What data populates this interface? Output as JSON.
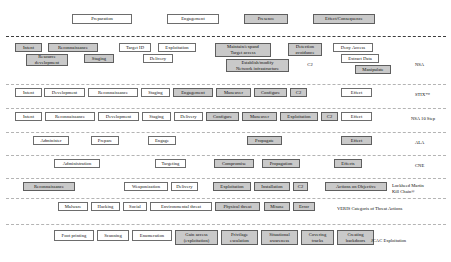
{
  "diagram": {
    "phase_header": {
      "label": "attack-phase-header",
      "items": [
        {
          "text": "Preparation",
          "shaded": false,
          "x": 72,
          "y": 14,
          "w": 60,
          "h": 10
        },
        {
          "text": "Engagement",
          "shaded": false,
          "x": 167,
          "y": 14,
          "w": 52,
          "h": 10
        },
        {
          "text": "Presence",
          "shaded": true,
          "x": 244,
          "y": 14,
          "w": 44,
          "h": 10
        },
        {
          "text": "Effect/Consequence",
          "shaded": true,
          "x": 313,
          "y": 14,
          "w": 62,
          "h": 10
        }
      ]
    },
    "rows": [
      {
        "label": "NSA",
        "label_x": 415,
        "label_y": 62,
        "boxes": [
          {
            "text": "Intent",
            "shaded": true,
            "x": 15,
            "y": 43,
            "w": 27,
            "h": 9
          },
          {
            "text": "Reconnaissance",
            "shaded": true,
            "x": 48,
            "y": 43,
            "w": 50,
            "h": 9
          },
          {
            "text": "Resource\ndevelopment",
            "shaded": true,
            "x": 26,
            "y": 54,
            "w": 42,
            "h": 12
          },
          {
            "text": "Staging",
            "shaded": true,
            "x": 84,
            "y": 54,
            "w": 30,
            "h": 9
          },
          {
            "text": "Target ID",
            "shaded": false,
            "x": 119,
            "y": 43,
            "w": 32,
            "h": 9
          },
          {
            "text": "Exploitation",
            "shaded": false,
            "x": 158,
            "y": 43,
            "w": 38,
            "h": 9
          },
          {
            "text": "Delivery",
            "shaded": false,
            "x": 143,
            "y": 54,
            "w": 30,
            "h": 9
          },
          {
            "text": "Maintain/expand\nTarget access",
            "shaded": true,
            "x": 215,
            "y": 43,
            "w": 56,
            "h": 14
          },
          {
            "text": "Establish/modify\nNetwork infrastructure",
            "shaded": true,
            "x": 226,
            "y": 59,
            "w": 63,
            "h": 13
          },
          {
            "text": "Detection\navoidance",
            "shaded": true,
            "x": 288,
            "y": 43,
            "w": 34,
            "h": 13
          },
          {
            "text": "C2",
            "shaded": false,
            "x": 304,
            "y": 61,
            "w": 12,
            "h": 8,
            "plain": true
          },
          {
            "text": "Deny Access",
            "shaded": false,
            "x": 333,
            "y": 43,
            "w": 40,
            "h": 9
          },
          {
            "text": "Extract Data",
            "shaded": false,
            "x": 341,
            "y": 54,
            "w": 38,
            "h": 9
          },
          {
            "text": "Manipulate",
            "shaded": true,
            "x": 355,
            "y": 65,
            "w": 36,
            "h": 9
          }
        ]
      },
      {
        "label": "STIX™",
        "label_x": 415,
        "label_y": 92,
        "boxes": [
          {
            "text": "Intent",
            "shaded": false,
            "x": 15,
            "y": 88,
            "w": 27,
            "h": 9
          },
          {
            "text": "Development",
            "shaded": false,
            "x": 44,
            "y": 88,
            "w": 41,
            "h": 9
          },
          {
            "text": "Reconnaissance",
            "shaded": false,
            "x": 88,
            "y": 88,
            "w": 50,
            "h": 9
          },
          {
            "text": "Staging",
            "shaded": false,
            "x": 141,
            "y": 88,
            "w": 29,
            "h": 9
          },
          {
            "text": "Engagement",
            "shaded": true,
            "x": 173,
            "y": 88,
            "w": 40,
            "h": 9
          },
          {
            "text": "Maneuver",
            "shaded": true,
            "x": 216,
            "y": 88,
            "w": 35,
            "h": 9
          },
          {
            "text": "Configure",
            "shaded": true,
            "x": 254,
            "y": 88,
            "w": 33,
            "h": 9
          },
          {
            "text": "C2",
            "shaded": true,
            "x": 290,
            "y": 88,
            "w": 17,
            "h": 9
          },
          {
            "text": "Effect",
            "shaded": false,
            "x": 341,
            "y": 88,
            "w": 31,
            "h": 9
          }
        ]
      },
      {
        "label": "NSA 10 Step",
        "label_x": 411,
        "label_y": 116,
        "boxes": [
          {
            "text": "Intent",
            "shaded": false,
            "x": 15,
            "y": 112,
            "w": 27,
            "h": 9
          },
          {
            "text": "Reconnaissance",
            "shaded": false,
            "x": 45,
            "y": 112,
            "w": 50,
            "h": 9
          },
          {
            "text": "Development",
            "shaded": false,
            "x": 98,
            "y": 112,
            "w": 41,
            "h": 9
          },
          {
            "text": "Staging",
            "shaded": false,
            "x": 142,
            "y": 112,
            "w": 29,
            "h": 9
          },
          {
            "text": "Delivery",
            "shaded": false,
            "x": 174,
            "y": 112,
            "w": 29,
            "h": 9
          },
          {
            "text": "Configure",
            "shaded": true,
            "x": 206,
            "y": 112,
            "w": 33,
            "h": 9
          },
          {
            "text": "Maneuver",
            "shaded": true,
            "x": 242,
            "y": 112,
            "w": 35,
            "h": 9
          },
          {
            "text": "Exploitation",
            "shaded": true,
            "x": 280,
            "y": 112,
            "w": 38,
            "h": 9
          },
          {
            "text": "C2",
            "shaded": true,
            "x": 321,
            "y": 112,
            "w": 17,
            "h": 9
          },
          {
            "text": "Effect",
            "shaded": false,
            "x": 341,
            "y": 112,
            "w": 31,
            "h": 9
          }
        ]
      },
      {
        "label": "ALA",
        "label_x": 415,
        "label_y": 140,
        "boxes": [
          {
            "text": "Administer",
            "shaded": false,
            "x": 33,
            "y": 136,
            "w": 36,
            "h": 9
          },
          {
            "text": "Prepare",
            "shaded": false,
            "x": 91,
            "y": 136,
            "w": 28,
            "h": 9
          },
          {
            "text": "Engage",
            "shaded": false,
            "x": 148,
            "y": 136,
            "w": 28,
            "h": 9
          },
          {
            "text": "Propagate",
            "shaded": true,
            "x": 247,
            "y": 136,
            "w": 35,
            "h": 9
          },
          {
            "text": "Effect",
            "shaded": true,
            "x": 341,
            "y": 136,
            "w": 31,
            "h": 9
          }
        ]
      },
      {
        "label": "CNE",
        "label_x": 415,
        "label_y": 163,
        "boxes": [
          {
            "text": "Administration",
            "shaded": false,
            "x": 54,
            "y": 159,
            "w": 46,
            "h": 9
          },
          {
            "text": "Targeting",
            "shaded": false,
            "x": 155,
            "y": 159,
            "w": 31,
            "h": 9
          },
          {
            "text": "Compromise",
            "shaded": true,
            "x": 214,
            "y": 159,
            "w": 40,
            "h": 9
          },
          {
            "text": "Propagation",
            "shaded": true,
            "x": 262,
            "y": 159,
            "w": 38,
            "h": 9
          },
          {
            "text": "Effects",
            "shaded": true,
            "x": 334,
            "y": 159,
            "w": 28,
            "h": 9
          }
        ]
      },
      {
        "label": "Lockheed Martin\nKill Chain®",
        "label_x": 392,
        "label_y": 183,
        "boxes": [
          {
            "text": "Reconnaissance",
            "shaded": true,
            "x": 23,
            "y": 182,
            "w": 52,
            "h": 9
          },
          {
            "text": "Weaponization",
            "shaded": false,
            "x": 124,
            "y": 182,
            "w": 44,
            "h": 9
          },
          {
            "text": "Delivery",
            "shaded": false,
            "x": 171,
            "y": 182,
            "w": 27,
            "h": 9
          },
          {
            "text": "Exploitation",
            "shaded": true,
            "x": 213,
            "y": 182,
            "w": 38,
            "h": 9
          },
          {
            "text": "Installation",
            "shaded": true,
            "x": 254,
            "y": 182,
            "w": 36,
            "h": 9
          },
          {
            "text": "C2",
            "shaded": true,
            "x": 293,
            "y": 182,
            "w": 15,
            "h": 9
          },
          {
            "text": "Actions on Objective",
            "shaded": true,
            "x": 325,
            "y": 182,
            "w": 62,
            "h": 9
          }
        ]
      },
      {
        "label": "VERIS Categoris of Threat Actions",
        "label_x": 337,
        "label_y": 206,
        "boxes": [
          {
            "text": "Malware",
            "shaded": false,
            "x": 58,
            "y": 202,
            "w": 30,
            "h": 9
          },
          {
            "text": "Hacking",
            "shaded": false,
            "x": 91,
            "y": 202,
            "w": 29,
            "h": 9
          },
          {
            "text": "Social",
            "shaded": false,
            "x": 123,
            "y": 202,
            "w": 24,
            "h": 9
          },
          {
            "text": "Environmental threat",
            "shaded": false,
            "x": 150,
            "y": 202,
            "w": 62,
            "h": 9
          },
          {
            "text": "Physical threat",
            "shaded": true,
            "x": 215,
            "y": 202,
            "w": 45,
            "h": 9
          },
          {
            "text": "Misuse",
            "shaded": true,
            "x": 264,
            "y": 202,
            "w": 26,
            "h": 9
          },
          {
            "text": "Error",
            "shaded": true,
            "x": 293,
            "y": 202,
            "w": 22,
            "h": 9
          }
        ]
      },
      {
        "label": "JCAC Exploitation",
        "label_x": 371,
        "label_y": 238,
        "boxes": [
          {
            "text": "Foot printing",
            "shaded": false,
            "x": 54,
            "y": 230,
            "w": 40,
            "h": 11
          },
          {
            "text": "Scanning",
            "shaded": false,
            "x": 97,
            "y": 230,
            "w": 32,
            "h": 11
          },
          {
            "text": "Enumeration",
            "shaded": false,
            "x": 132,
            "y": 230,
            "w": 40,
            "h": 11
          },
          {
            "text": "Gain access\n(exploitation)",
            "shaded": true,
            "x": 175,
            "y": 230,
            "w": 43,
            "h": 15
          },
          {
            "text": "Privilage\nescalation",
            "shaded": true,
            "x": 221,
            "y": 230,
            "w": 37,
            "h": 15
          },
          {
            "text": "Situational\nawareness",
            "shaded": true,
            "x": 261,
            "y": 230,
            "w": 37,
            "h": 15
          },
          {
            "text": "Covering\ntracks",
            "shaded": true,
            "x": 301,
            "y": 230,
            "w": 33,
            "h": 15
          },
          {
            "text": "Creating\nbackdoors",
            "shaded": true,
            "x": 337,
            "y": 230,
            "w": 37,
            "h": 15
          }
        ]
      }
    ],
    "separators": [
      {
        "y": 36,
        "style": "bold"
      },
      {
        "y": 84,
        "style": "light"
      },
      {
        "y": 108,
        "style": "light"
      },
      {
        "y": 132,
        "style": "light"
      },
      {
        "y": 155,
        "style": "light"
      },
      {
        "y": 178,
        "style": "light"
      },
      {
        "y": 198,
        "style": "light"
      },
      {
        "y": 224,
        "style": "light"
      }
    ]
  }
}
